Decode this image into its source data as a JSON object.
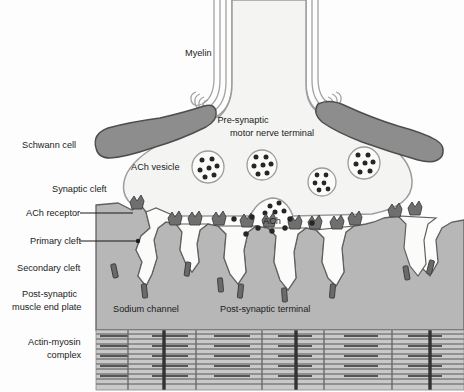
{
  "figure": {
    "type": "labeled-anatomical-diagram",
    "width": 464,
    "height": 392
  },
  "colors": {
    "background": "#fdfdfd",
    "schwann_cell": "#8d8d8d",
    "schwann_cell_outline": "#4a4a4a",
    "nerve_terminal_fill": "#f4f4f2",
    "nerve_terminal_outline": "#9a9a9a",
    "myelin_line": "#a0a0a0",
    "muscle_cytoplasm": "#b7b7b7",
    "muscle_outline": "#5f5f5f",
    "secondary_cleft_fill": "#fbfbfa",
    "ach_receptor": "#707070",
    "sodium_channel": "#6a6a6a",
    "ach_dot": "#2b2b2b",
    "vesicle_outline": "#9a9a9a",
    "sarcomere_filament": "#7d7d7d",
    "sarcomere_zline": "#3d3d3d",
    "label_text": "#1b1b1b"
  },
  "labels": {
    "myelin": "Myelin",
    "pre_synaptic_line1": "Pre-synaptic",
    "pre_synaptic_line2": "motor nerve terminal",
    "schwann_cell": "Schwann cell",
    "ach_vesicle": "ACh vesicle",
    "synaptic_cleft": "Synaptic cleft",
    "ach_receptor": "ACh receptor",
    "primary_cleft": "Primary cleft",
    "secondary_cleft": "Secondary cleft",
    "post_synaptic_plate_line1": "Post-synaptic",
    "post_synaptic_plate_line2": "muscle end plate",
    "sodium_channel": "Sodium channel",
    "post_synaptic_terminal": "Post-synaptic terminal",
    "ach": "ACh",
    "actin_myosin_line1": "Actin-myosin",
    "actin_myosin_line2": "complex"
  },
  "structures": {
    "myelin_bundles": [
      {
        "name": "left-myelin-bundle",
        "lines": 4
      },
      {
        "name": "right-myelin-bundle",
        "lines": 4
      }
    ],
    "schwann_cells": [
      {
        "name": "left-schwann-cell"
      },
      {
        "name": "right-schwann-cell"
      }
    ],
    "ach_vesicles": [
      {
        "cx": 208,
        "cy": 167,
        "r": 16,
        "granules": 7
      },
      {
        "cx": 262,
        "cy": 165,
        "r": 15,
        "granules": 7
      },
      {
        "cx": 322,
        "cy": 182,
        "r": 14,
        "granules": 6
      },
      {
        "cx": 364,
        "cy": 163,
        "r": 16,
        "granules": 7
      },
      {
        "cx": 272,
        "cy": 205,
        "r": 13,
        "granules": 5,
        "note": "fusing-vesicle"
      }
    ],
    "ach_dots_in_cleft": [
      {
        "cx": 234,
        "cy": 219
      },
      {
        "cx": 252,
        "cy": 217
      },
      {
        "cx": 290,
        "cy": 219
      },
      {
        "cx": 312,
        "cy": 223
      },
      {
        "cx": 258,
        "cy": 227
      },
      {
        "cx": 272,
        "cy": 230
      },
      {
        "cx": 285,
        "cy": 227
      },
      {
        "cx": 246,
        "cy": 233
      }
    ],
    "ach_receptor_count": 14,
    "sodium_channel_count": 9,
    "junctional_fold_count": 7,
    "sarcomere": {
      "rows": 11,
      "z_lines_thick": 3,
      "z_lines_thin": 5
    }
  }
}
